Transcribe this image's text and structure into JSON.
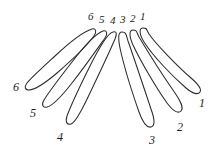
{
  "figure": {
    "style": {
      "background_color": "#ffffff",
      "ink_color": "#2b2b2b",
      "label_color": "#1c1c1c",
      "stroke_width": 1.05
    },
    "loop_count": 6
  },
  "top_labels": [
    {
      "id": "top-label-6",
      "text": "6",
      "x": 88,
      "y": 11
    },
    {
      "id": "top-label-5",
      "text": "5",
      "x": 99,
      "y": 14
    },
    {
      "id": "top-label-4",
      "text": "4",
      "x": 110,
      "y": 15
    },
    {
      "id": "top-label-3",
      "text": "3",
      "x": 120,
      "y": 14
    },
    {
      "id": "top-label-2",
      "text": "2",
      "x": 130,
      "y": 13
    },
    {
      "id": "top-label-1",
      "text": "1",
      "x": 140,
      "y": 11
    }
  ],
  "tip_labels": [
    {
      "id": "tip-label-6",
      "text": "6",
      "x": 13,
      "y": 81
    },
    {
      "id": "tip-label-5",
      "text": "5",
      "x": 30,
      "y": 107
    },
    {
      "id": "tip-label-4",
      "text": "4",
      "x": 57,
      "y": 131
    },
    {
      "id": "tip-label-3",
      "text": "3",
      "x": 149,
      "y": 134
    },
    {
      "id": "tip-label-2",
      "text": "2",
      "x": 177,
      "y": 121
    },
    {
      "id": "tip-label-1",
      "text": "1",
      "x": 199,
      "y": 97
    }
  ],
  "loops": [
    {
      "id": "loop-6",
      "number": "6",
      "side": "left",
      "path": "M 92,29 C 85,31 70,42 55,56 C 42,68 31,78 27,83 C 24,87 25,90 29,90 C 34,90 44,84 57,73 C 72,60 88,44 94,36 C 97,32 96,28 92,29 Z"
    },
    {
      "id": "loop-5",
      "number": "5",
      "side": "left",
      "path": "M 103,31 C 97,33 85,45 72,62 C 58,80 47,95 44,100 C 41,105 43,108 47,107 C 52,106 61,97 72,83 C 86,65 100,45 105,38 C 108,34 107,30 103,31 Z"
    },
    {
      "id": "loop-4",
      "number": "4",
      "side": "left",
      "path": "M 113,32 C 108,33 100,46 90,66 C 79,88 70,108 67,116 C 65,122 67,125 71,124 C 75,123 81,112 89,95 C 100,72 112,46 115,39 C 117,34 117,31 113,32 Z"
    },
    {
      "id": "loop-3",
      "number": "3",
      "side": "right",
      "path": "M 122,32 C 118,32 118,38 120,48 C 123,62 132,92 139,112 C 143,123 147,128 151,127 C 155,126 155,120 151,109 C 144,88 133,55 128,41 C 126,34 126,32 122,32 Z"
    },
    {
      "id": "loop-2",
      "number": "2",
      "side": "right",
      "path": "M 133,30 C 129,30 129,36 133,45 C 140,60 155,86 167,103 C 173,111 178,114 181,111 C 184,108 181,102 175,93 C 163,76 145,47 139,37 C 136,31 137,30 133,30 Z"
    },
    {
      "id": "loop-1",
      "number": "1",
      "side": "right",
      "path": "M 143,28 C 139,28 139,34 144,42 C 153,56 172,76 186,88 C 193,94 198,95 200,92 C 202,89 198,84 191,78 C 177,66 155,43 149,34 C 146,29 147,28 143,28 Z"
    }
  ]
}
